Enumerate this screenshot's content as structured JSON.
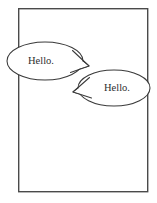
{
  "panel": {
    "name": "comic-panel",
    "background_color": "#ffffff",
    "border_color": "#4a4a4a",
    "frame": {
      "x": 18,
      "y": 8,
      "width": 130,
      "height": 184
    }
  },
  "bubbles": [
    {
      "id": "speech-bubble-left",
      "text": "Hello.",
      "speaker_side": "left",
      "tail_direction": "right",
      "fill_color": "#ffffff",
      "outline_color": "#3a3a3a",
      "text_color": "#2e2e2e",
      "ellipse": {
        "cx": 45,
        "cy": 61,
        "rx": 38,
        "ry": 19
      },
      "text_pos": {
        "x": 41,
        "y": 61.5
      },
      "tail_path": "M 77,53 L 89,66 L 74,72 Z"
    },
    {
      "id": "speech-bubble-right",
      "text": "Hello.",
      "speaker_side": "right",
      "tail_direction": "left",
      "fill_color": "#ffffff",
      "outline_color": "#3a3a3a",
      "text_color": "#2e2e2e",
      "ellipse": {
        "cx": 114,
        "cy": 88,
        "rx": 36,
        "ry": 18
      },
      "text_pos": {
        "x": 117,
        "y": 88.5
      },
      "tail_path": "M 86,79 L 73,92 L 89,97 Z"
    }
  ]
}
